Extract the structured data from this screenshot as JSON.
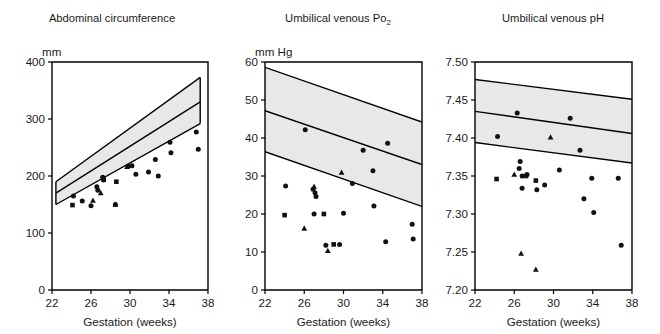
{
  "figure": {
    "title": "",
    "panel_count": 3,
    "background_color": "#ffffff",
    "band_color": "#e8e8e8",
    "marker_color": "#111111"
  },
  "chart_data": [
    {
      "type": "scatter",
      "title": "Abdominal circumference",
      "ylabel": "mm",
      "xlabel": "Gestation (weeks)",
      "xlim": [
        22,
        38
      ],
      "ylim": [
        0,
        400
      ],
      "xticks": [
        22,
        26,
        30,
        34,
        38
      ],
      "yticks": [
        0,
        100,
        200,
        300,
        400
      ],
      "xtick_labels": [
        "22",
        "26",
        "30",
        "34",
        "38"
      ],
      "ytick_labels": [
        "0",
        "100",
        "200",
        "300",
        "400"
      ],
      "grid": false,
      "legend": "none",
      "reference_band": {
        "label": "normal range",
        "x": [
          22.4,
          37.2
        ],
        "upper": [
          190,
          373
        ],
        "median": [
          170,
          330
        ],
        "lower": [
          150,
          292
        ]
      },
      "series": [
        {
          "name": "circles",
          "marker": "circle",
          "points": [
            [
              24.2,
              165
            ],
            [
              25.1,
              156
            ],
            [
              26.0,
              148
            ],
            [
              26.6,
              181
            ],
            [
              26.7,
              175
            ],
            [
              27.2,
              198
            ],
            [
              27.3,
              193
            ],
            [
              28.5,
              150
            ],
            [
              29.8,
              217
            ],
            [
              30.2,
              218
            ],
            [
              30.6,
              203
            ],
            [
              31.9,
              207
            ],
            [
              32.6,
              229
            ],
            [
              32.9,
              200
            ],
            [
              34.1,
              259
            ],
            [
              34.2,
              241
            ],
            [
              36.8,
              277
            ],
            [
              37.0,
              247
            ]
          ]
        },
        {
          "name": "squares",
          "marker": "square",
          "points": [
            [
              24.1,
              149
            ],
            [
              27.3,
              194
            ],
            [
              28.6,
              190
            ]
          ]
        },
        {
          "name": "triangles",
          "marker": "triangle",
          "points": [
            [
              26.2,
              157
            ],
            [
              27.0,
              170
            ],
            [
              28.5,
              150
            ],
            [
              29.7,
              216
            ]
          ]
        }
      ]
    },
    {
      "type": "scatter",
      "title": "Umbilical venous Po2",
      "title_base": "Umbilical venous Po",
      "title_sub": "2",
      "ylabel": "mm Hg",
      "xlabel": "Gestation (weeks)",
      "xlim": [
        22,
        38
      ],
      "ylim": [
        0,
        60
      ],
      "xticks": [
        22,
        26,
        30,
        34,
        38
      ],
      "yticks": [
        0,
        10,
        20,
        30,
        40,
        50,
        60
      ],
      "xtick_labels": [
        "22",
        "26",
        "30",
        "34",
        "38"
      ],
      "ytick_labels": [
        "0",
        "10",
        "20",
        "30",
        "40",
        "50",
        "60"
      ],
      "grid": false,
      "legend": "none",
      "reference_band": {
        "label": "normal range",
        "x": [
          22.0,
          38.0
        ],
        "upper": [
          58.6,
          44.2
        ],
        "median": [
          47.2,
          33.0
        ],
        "lower": [
          36.4,
          22.0
        ]
      },
      "series": [
        {
          "name": "circles",
          "marker": "circle",
          "points": [
            [
              24.1,
              27.4
            ],
            [
              26.1,
              42.2
            ],
            [
              26.9,
              26.5
            ],
            [
              27.1,
              25.6
            ],
            [
              27.2,
              24.6
            ],
            [
              27.0,
              20.0
            ],
            [
              28.2,
              11.8
            ],
            [
              29.6,
              12.0
            ],
            [
              30.0,
              20.2
            ],
            [
              30.9,
              28.0
            ],
            [
              32.0,
              36.8
            ],
            [
              33.0,
              31.4
            ],
            [
              33.1,
              22.1
            ],
            [
              34.3,
              12.7
            ],
            [
              34.5,
              38.6
            ],
            [
              37.0,
              17.3
            ],
            [
              37.1,
              13.4
            ]
          ]
        },
        {
          "name": "squares",
          "marker": "square",
          "points": [
            [
              24.0,
              19.7
            ],
            [
              28.0,
              20.0
            ],
            [
              29.0,
              12.0
            ]
          ]
        },
        {
          "name": "triangles",
          "marker": "triangle",
          "points": [
            [
              26.0,
              16.2
            ],
            [
              27.0,
              27.2
            ],
            [
              28.4,
              10.3
            ],
            [
              29.8,
              30.9
            ]
          ]
        }
      ]
    },
    {
      "type": "scatter",
      "title": "Umbilical venous pH",
      "ylabel": "",
      "xlabel": "Gestation (weeks)",
      "xlim": [
        22,
        38
      ],
      "ylim": [
        7.2,
        7.5
      ],
      "xticks": [
        22,
        26,
        30,
        34,
        38
      ],
      "yticks": [
        7.2,
        7.25,
        7.3,
        7.35,
        7.4,
        7.45,
        7.5
      ],
      "xtick_labels": [
        "22",
        "26",
        "30",
        "34",
        "38"
      ],
      "ytick_labels": [
        "7.20",
        "7.25",
        "7.30",
        "7.35",
        "7.40",
        "7.45",
        "7.50"
      ],
      "grid": false,
      "legend": "none",
      "reference_band": {
        "label": "normal range",
        "x": [
          22.0,
          38.0
        ],
        "upper": [
          7.477,
          7.451
        ],
        "median": [
          7.435,
          7.406
        ],
        "lower": [
          7.394,
          7.367
        ]
      },
      "series": [
        {
          "name": "circles",
          "marker": "circle",
          "points": [
            [
              24.3,
              7.402
            ],
            [
              26.3,
              7.433
            ],
            [
              26.6,
              7.369
            ],
            [
              26.5,
              7.36
            ],
            [
              26.8,
              7.35
            ],
            [
              26.8,
              7.334
            ],
            [
              27.3,
              7.352
            ],
            [
              28.3,
              7.332
            ],
            [
              29.1,
              7.338
            ],
            [
              30.6,
              7.358
            ],
            [
              31.7,
              7.426
            ],
            [
              32.7,
              7.384
            ],
            [
              33.1,
              7.32
            ],
            [
              33.9,
              7.347
            ],
            [
              34.1,
              7.302
            ],
            [
              36.6,
              7.347
            ],
            [
              36.9,
              7.259
            ]
          ]
        },
        {
          "name": "squares",
          "marker": "square",
          "points": [
            [
              24.2,
              7.346
            ],
            [
              27.2,
              7.35
            ],
            [
              28.2,
              7.344
            ]
          ]
        },
        {
          "name": "triangles",
          "marker": "triangle",
          "points": [
            [
              26.0,
              7.352
            ],
            [
              26.7,
              7.248
            ],
            [
              28.2,
              7.227
            ],
            [
              29.7,
              7.401
            ]
          ]
        }
      ]
    }
  ]
}
